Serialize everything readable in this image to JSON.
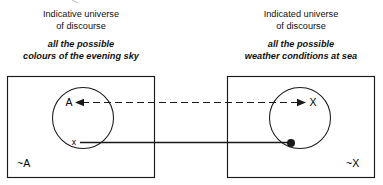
{
  "diagram": {
    "type": "set-mapping-diagram",
    "left_panel": {
      "heading_line1": "Indicative universe",
      "heading_line2": "of discourse",
      "subtitle_line1": "all the possible",
      "subtitle_line2": "colours of the evening sky",
      "set_label": "A",
      "element_label": "x",
      "complement_label": "~A"
    },
    "right_panel": {
      "heading_line1": "Indicated universe",
      "heading_line2": "of discourse",
      "subtitle_line1": "all the possible",
      "subtitle_line2": "weather conditions at sea",
      "set_label": "X",
      "element_marker": "filled-dot",
      "complement_label": "~X"
    },
    "connectors": [
      {
        "name": "set-correspondence",
        "style": "dashed",
        "arrow_left": true,
        "arrow_right": true,
        "from": "A",
        "to": "X"
      },
      {
        "name": "element-correspondence",
        "style": "solid",
        "arrow_left": false,
        "arrow_right": false,
        "from": "x",
        "to": "filled-dot"
      }
    ],
    "colors": {
      "stroke": "#1a1a1a",
      "text": "#000000",
      "background": "#ffffff"
    }
  }
}
